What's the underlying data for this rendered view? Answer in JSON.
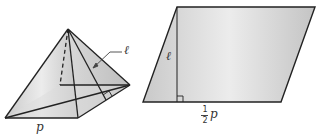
{
  "figure": {
    "pyramid": {
      "base_label": "p",
      "slant_label": "ℓ"
    },
    "parallelogram": {
      "height_label": "ℓ",
      "base_label_numerator": "1",
      "base_label_denominator": "2",
      "base_label_var": "p"
    }
  },
  "colors": {
    "stroke": "#222222",
    "fill_light": "#e8e8e8",
    "fill_dark": "#c4c4c4"
  }
}
